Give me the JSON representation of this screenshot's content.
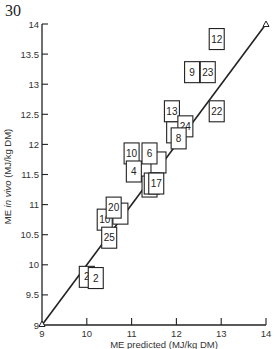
{
  "figure": {
    "number": "30"
  },
  "chart_data": {
    "type": "scatter",
    "title": "",
    "xlabel": "ME predicted (MJ/kg DM)",
    "ylabel": "ME in vivo (MJ/kg DM)",
    "ylabel_parts": {
      "prefix": "ME ",
      "italic": "in vivo",
      "suffix": " (MJ/kg DM)"
    },
    "xlim": [
      9,
      14
    ],
    "ylim": [
      9,
      14
    ],
    "x_ticks": [
      "9",
      "10",
      "11",
      "12",
      "13",
      "14"
    ],
    "y_ticks": [
      "9",
      "9.5",
      "10",
      "10.5",
      "11",
      "11.5",
      "12",
      "12.5",
      "13",
      "13.5",
      "14"
    ],
    "grid": false,
    "legend": null,
    "reference_line": {
      "label": "line of equality (y = x)",
      "from": [
        9,
        9
      ],
      "to": [
        14,
        14
      ]
    },
    "marker": "numbered square boxes",
    "points": [
      {
        "label": "12",
        "x": 12.9,
        "y": 13.75
      },
      {
        "label": "9",
        "x": 12.35,
        "y": 13.2
      },
      {
        "label": "23",
        "x": 12.7,
        "y": 13.2
      },
      {
        "label": "13",
        "x": 11.9,
        "y": 12.55
      },
      {
        "label": "22",
        "x": 12.9,
        "y": 12.55
      },
      {
        "label": "",
        "x": 11.95,
        "y": 12.2
      },
      {
        "label": "24",
        "x": 12.2,
        "y": 12.3
      },
      {
        "label": "8",
        "x": 12.05,
        "y": 12.1
      },
      {
        "label": "",
        "x": 11.6,
        "y": 11.7
      },
      {
        "label": "10",
        "x": 11.0,
        "y": 11.85
      },
      {
        "label": "6",
        "x": 11.4,
        "y": 11.85
      },
      {
        "label": "4",
        "x": 11.05,
        "y": 11.55
      },
      {
        "label": "",
        "x": 11.4,
        "y": 11.3
      },
      {
        "label": "",
        "x": 11.45,
        "y": 11.35
      },
      {
        "label": "17",
        "x": 11.55,
        "y": 11.35
      },
      {
        "label": "",
        "x": 10.75,
        "y": 10.85
      },
      {
        "label": "10",
        "x": 10.4,
        "y": 10.75
      },
      {
        "label": "20",
        "x": 10.6,
        "y": 10.95
      },
      {
        "label": "25",
        "x": 10.5,
        "y": 10.45
      },
      {
        "label": "2",
        "x": 10.0,
        "y": 9.8
      },
      {
        "label": "2",
        "x": 10.2,
        "y": 9.78
      }
    ]
  }
}
